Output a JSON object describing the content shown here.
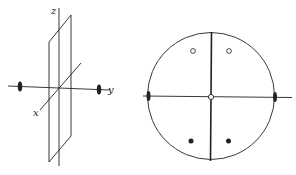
{
  "figure": {
    "left_panel": {
      "description": "3D axes with mirror plane containing z and y axes and 2-fold rotation axis along y",
      "axes": {
        "x": {
          "label": "x"
        },
        "y": {
          "label": "y"
        },
        "z": {
          "label": "z"
        }
      },
      "symmetry_elements": [
        {
          "type": "mirror-plane",
          "orientation": "xz-plane"
        },
        {
          "type": "2-fold-axis",
          "along": "y"
        }
      ]
    },
    "right_panel": {
      "description": "Stereographic projection for point group 2mm (mm2)",
      "great_circle_lines": [
        "vertical-mirror",
        "horizontal-axis"
      ],
      "open_circles": [
        {
          "position": "upper-left"
        },
        {
          "position": "upper-right"
        }
      ],
      "filled_dots": [
        {
          "position": "lower-left"
        },
        {
          "position": "lower-right"
        }
      ],
      "center_marker": "open-circle",
      "twofold_symbols": [
        "left-edge",
        "right-edge"
      ]
    },
    "colors": {
      "stroke": "#222222",
      "background": "#ffffff"
    }
  }
}
